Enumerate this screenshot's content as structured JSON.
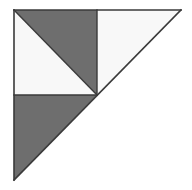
{
  "figure": {
    "canvas": {
      "width": 192,
      "height": 190,
      "background": "#ffffff"
    },
    "palette": {
      "dark_fill": "#6e6e6e",
      "light_fill": "#f8f8f8",
      "outline": "#3a3a3a",
      "background": "#ffffff"
    },
    "outline_width": "1.6",
    "vertices": {
      "top_left": "14,10",
      "top_right": "181,10",
      "bottom_left": "14,180",
      "center": "97,95",
      "top_mid": "97,10",
      "left_mid": "14,95"
    },
    "regions": [
      {
        "id": "top-left-upper-triangle",
        "label": "Top-left upper dark triangle",
        "points": "14,10 97,10 97,95",
        "fill": "#6e6e6e"
      },
      {
        "id": "top-left-lower-triangle",
        "label": "Top-left lower white triangle",
        "points": "14,10 97,95 14,95",
        "fill": "#f8f8f8"
      },
      {
        "id": "top-right-triangle",
        "label": "Top-right white triangle",
        "points": "97,10 181,10 97,95",
        "fill": "#f8f8f8"
      },
      {
        "id": "bottom-left-triangle",
        "label": "Bottom-left dark triangle",
        "points": "14,95 97,95 14,180",
        "fill": "#6e6e6e"
      }
    ],
    "edges": [
      {
        "id": "outer-top-edge",
        "label": "Top edge",
        "x1": "14",
        "y1": "10",
        "x2": "181",
        "y2": "10"
      },
      {
        "id": "outer-left-edge",
        "label": "Left edge",
        "x1": "14",
        "y1": "10",
        "x2": "14",
        "y2": "180"
      },
      {
        "id": "outer-hypotenuse",
        "label": "Hypotenuse",
        "x1": "181",
        "y1": "10",
        "x2": "14",
        "y2": "180"
      },
      {
        "id": "inner-vertical",
        "label": "Center vertical line",
        "x1": "97",
        "y1": "10",
        "x2": "97",
        "y2": "95"
      },
      {
        "id": "inner-horizontal",
        "label": "Center horizontal line",
        "x1": "14",
        "y1": "95",
        "x2": "97",
        "y2": "95"
      },
      {
        "id": "inner-diagonal",
        "label": "Quadrant diagonal",
        "x1": "14",
        "y1": "10",
        "x2": "97",
        "y2": "95"
      }
    ]
  }
}
